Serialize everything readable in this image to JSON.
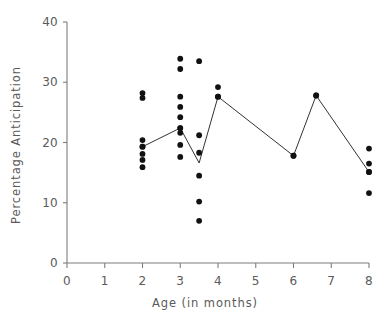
{
  "chart_data": {
    "type": "scatter",
    "title": "",
    "xlabel": "Age (in months)",
    "ylabel": "Percentage Anticipation",
    "xlim": [
      0,
      8
    ],
    "ylim": [
      0,
      40
    ],
    "xticks": [
      0,
      1,
      2,
      3,
      4,
      5,
      6,
      7,
      8
    ],
    "yticks": [
      0,
      10,
      20,
      30,
      40
    ],
    "xtick_labels": [
      "0",
      "1",
      "2",
      "3",
      "4",
      "5",
      "6",
      "7",
      "8"
    ],
    "ytick_labels": [
      "0",
      "10",
      "20",
      "30",
      "40"
    ],
    "grid": false,
    "legend": null,
    "marker": "filled-circle",
    "marker_color": "#111111",
    "line_color": "#333333",
    "axis_color": "#7d7d7d",
    "series": [
      {
        "name": "Individual observations",
        "type": "scatter",
        "points": [
          {
            "x": 2.0,
            "y": 28.2
          },
          {
            "x": 2.0,
            "y": 27.4
          },
          {
            "x": 2.0,
            "y": 20.4
          },
          {
            "x": 2.0,
            "y": 19.3
          },
          {
            "x": 2.0,
            "y": 18.1
          },
          {
            "x": 2.0,
            "y": 17.1
          },
          {
            "x": 2.0,
            "y": 15.9
          },
          {
            "x": 3.0,
            "y": 33.9
          },
          {
            "x": 3.0,
            "y": 32.2
          },
          {
            "x": 3.0,
            "y": 27.6
          },
          {
            "x": 3.0,
            "y": 25.9
          },
          {
            "x": 3.0,
            "y": 24.2
          },
          {
            "x": 3.0,
            "y": 22.4
          },
          {
            "x": 3.0,
            "y": 21.6
          },
          {
            "x": 3.0,
            "y": 19.6
          },
          {
            "x": 3.0,
            "y": 17.6
          },
          {
            "x": 3.5,
            "y": 33.5
          },
          {
            "x": 3.5,
            "y": 21.2
          },
          {
            "x": 3.5,
            "y": 18.3
          },
          {
            "x": 3.5,
            "y": 14.5
          },
          {
            "x": 3.5,
            "y": 10.2
          },
          {
            "x": 3.5,
            "y": 7.0
          },
          {
            "x": 4.0,
            "y": 29.2
          },
          {
            "x": 4.0,
            "y": 27.6
          },
          {
            "x": 6.0,
            "y": 17.8
          },
          {
            "x": 6.6,
            "y": 27.8
          },
          {
            "x": 8.0,
            "y": 19.0
          },
          {
            "x": 8.0,
            "y": 16.5
          },
          {
            "x": 8.0,
            "y": 15.1
          },
          {
            "x": 8.0,
            "y": 11.6
          }
        ]
      },
      {
        "name": "Mean trend",
        "type": "line",
        "points": [
          {
            "x": 2.0,
            "y": 19.3
          },
          {
            "x": 3.0,
            "y": 22.4
          },
          {
            "x": 3.5,
            "y": 16.6
          },
          {
            "x": 4.0,
            "y": 27.6
          },
          {
            "x": 6.0,
            "y": 17.8
          },
          {
            "x": 6.6,
            "y": 27.8
          },
          {
            "x": 8.0,
            "y": 15.1
          }
        ]
      }
    ]
  }
}
